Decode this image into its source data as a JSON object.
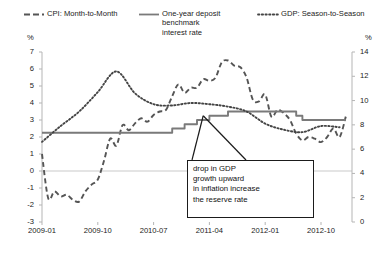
{
  "legend": {
    "items": [
      {
        "key": "cpi",
        "label": "CPI: Month-to-Month",
        "style": "dashed",
        "color": "#555555"
      },
      {
        "key": "deposit",
        "label": "One-year deposit\nbenchmark\ninterest rate",
        "style": "solid",
        "color": "#7a7a7a"
      },
      {
        "key": "gdp",
        "label": "GDP: Season-to-Season",
        "style": "dotted",
        "color": "#444444"
      }
    ]
  },
  "axes": {
    "left_unit": "%",
    "right_unit": "%",
    "left_ticks": [
      "7",
      "6",
      "5",
      "4",
      "3",
      "2",
      "1",
      "0",
      "-1",
      "-2",
      "-3"
    ],
    "right_ticks": [
      "14",
      "12",
      "10",
      "8",
      "6",
      "4",
      "2",
      "0"
    ],
    "x_ticks": [
      "2009-01",
      "2009-10",
      "2010-07",
      "2011-04",
      "2012-01",
      "2012-10"
    ]
  },
  "annotation": {
    "lines": [
      "drop in GDP",
      "growth upward",
      "in inflation increase",
      "the reserve rate"
    ]
  },
  "chart_data": {
    "type": "line",
    "title": "",
    "xlabel": "",
    "ylabel": "%",
    "y2label": "%",
    "ylim": [
      -3,
      7
    ],
    "y2lim": [
      0,
      14
    ],
    "grid": "horizontal-zero-only",
    "legend_position": "top",
    "x_tick_labels": [
      "2009-01",
      "2009-10",
      "2010-07",
      "2011-04",
      "2012-01",
      "2012-10"
    ],
    "x_tick_months": [
      "2009-01",
      "2009-10",
      "2010-07",
      "2011-04",
      "2012-01",
      "2012-10"
    ],
    "x_range": [
      "2009-01",
      "2013-03"
    ],
    "series": [
      {
        "name": "CPI: Month-to-Month",
        "axis": "left",
        "style": "dashed",
        "x": [
          "2009-01",
          "2009-02",
          "2009-03",
          "2009-04",
          "2009-05",
          "2009-06",
          "2009-07",
          "2009-08",
          "2009-09",
          "2009-10",
          "2009-11",
          "2009-12",
          "2010-01",
          "2010-02",
          "2010-03",
          "2010-04",
          "2010-05",
          "2010-06",
          "2010-07",
          "2010-08",
          "2010-09",
          "2010-10",
          "2010-11",
          "2010-12",
          "2011-01",
          "2011-02",
          "2011-03",
          "2011-04",
          "2011-05",
          "2011-06",
          "2011-07",
          "2011-08",
          "2011-09",
          "2011-10",
          "2011-11",
          "2011-12",
          "2012-01",
          "2012-02",
          "2012-03",
          "2012-04",
          "2012-05",
          "2012-06",
          "2012-07",
          "2012-08",
          "2012-09",
          "2012-10",
          "2012-11",
          "2012-12",
          "2013-01",
          "2013-02"
        ],
        "values": [
          1.0,
          -1.6,
          -1.2,
          -1.5,
          -1.4,
          -1.7,
          -1.8,
          -1.2,
          -0.8,
          -0.5,
          0.6,
          1.9,
          1.5,
          2.7,
          2.4,
          2.8,
          3.1,
          2.9,
          3.3,
          3.5,
          3.6,
          4.4,
          5.1,
          4.6,
          4.9,
          4.9,
          5.4,
          5.3,
          5.5,
          6.4,
          6.5,
          6.2,
          6.1,
          5.5,
          4.2,
          4.1,
          4.5,
          3.2,
          3.6,
          3.4,
          3.0,
          2.2,
          1.8,
          2.0,
          1.9,
          1.7,
          2.0,
          2.5,
          2.0,
          3.2
        ]
      },
      {
        "name": "One-year deposit benchmark interest rate",
        "axis": "left",
        "style": "solid",
        "x": [
          "2009-01",
          "2010-09",
          "2010-10",
          "2010-12",
          "2011-02",
          "2011-04",
          "2011-07",
          "2012-06",
          "2012-07",
          "2013-02"
        ],
        "values": [
          2.25,
          2.25,
          2.5,
          2.75,
          3.0,
          3.25,
          3.5,
          3.25,
          3.0,
          3.0
        ]
      },
      {
        "name": "GDP: Season-to-Season",
        "axis": "right",
        "style": "dotted",
        "x": [
          "2009-01",
          "2009-04",
          "2009-07",
          "2009-10",
          "2010-01",
          "2010-04",
          "2010-07",
          "2010-10",
          "2011-01",
          "2011-04",
          "2011-07",
          "2011-10",
          "2012-01",
          "2012-04",
          "2012-07",
          "2012-10",
          "2013-01"
        ],
        "values": [
          6.6,
          7.9,
          9.1,
          10.7,
          12.4,
          10.6,
          9.7,
          9.6,
          9.8,
          9.7,
          9.5,
          9.1,
          8.1,
          7.6,
          7.4,
          7.9,
          7.8
        ]
      }
    ]
  }
}
